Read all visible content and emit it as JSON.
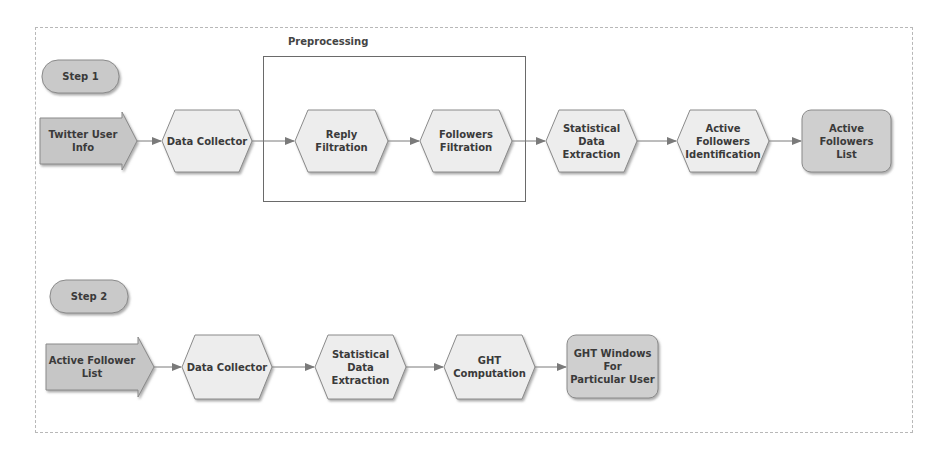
{
  "diagram": {
    "colors": {
      "hexagon_fill": "#ededed",
      "start_arrow_fill": "#c6c6c6",
      "terminal_fill": "#cfcfcf",
      "step_pill_fill": "#c9c9c9",
      "stroke": "#777777",
      "connector": "#7a7a7a"
    },
    "group": {
      "label": "Preprocessing"
    },
    "step1": {
      "label": "Step 1",
      "nodes": [
        {
          "id": "twitter-user-info",
          "shape": "arrow",
          "label": "Twitter User Info"
        },
        {
          "id": "data-collector",
          "shape": "hexagon",
          "label": "Data Collector"
        },
        {
          "id": "reply-filtration",
          "shape": "hexagon",
          "label": "Reply Filtration"
        },
        {
          "id": "followers-filtration",
          "shape": "hexagon",
          "label": "Followers\nFiltration"
        },
        {
          "id": "statistical-data-extraction",
          "shape": "hexagon",
          "label": "Statistical Data\nExtraction"
        },
        {
          "id": "active-followers-identification",
          "shape": "hexagon",
          "label": "Active\nFollowers\nIdentification"
        },
        {
          "id": "active-followers-list",
          "shape": "rounded-rect",
          "label": "Active Followers\nList"
        }
      ]
    },
    "step2": {
      "label": "Step 2",
      "nodes": [
        {
          "id": "active-follower-list",
          "shape": "arrow",
          "label": "Active Follower List"
        },
        {
          "id": "data-collector-2",
          "shape": "hexagon",
          "label": "Data Collector"
        },
        {
          "id": "statistical-data-extraction-2",
          "shape": "hexagon",
          "label": "Statistical Data\nExtraction"
        },
        {
          "id": "ght-computation",
          "shape": "hexagon",
          "label": "GHT\nComputation"
        },
        {
          "id": "ght-windows",
          "shape": "rounded-rect",
          "label": "GHT Windows For\nParticular User"
        }
      ]
    },
    "edges": [
      [
        "twitter-user-info",
        "data-collector"
      ],
      [
        "data-collector",
        "reply-filtration"
      ],
      [
        "reply-filtration",
        "followers-filtration"
      ],
      [
        "followers-filtration",
        "statistical-data-extraction"
      ],
      [
        "statistical-data-extraction",
        "active-followers-identification"
      ],
      [
        "active-followers-identification",
        "active-followers-list"
      ],
      [
        "active-follower-list",
        "data-collector-2"
      ],
      [
        "data-collector-2",
        "statistical-data-extraction-2"
      ],
      [
        "statistical-data-extraction-2",
        "ght-computation"
      ],
      [
        "ght-computation",
        "ght-windows"
      ]
    ]
  }
}
